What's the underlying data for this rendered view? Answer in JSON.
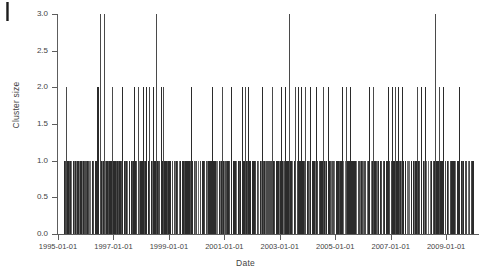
{
  "figure": {
    "artifact": "page-crop-mark"
  },
  "chart_data": {
    "type": "bar",
    "title": "",
    "subtitle": "",
    "xlabel": "Date",
    "ylabel": "Cluster size",
    "grid": false,
    "legend": null,
    "xlim": [
      "1995-01-01",
      "2009-12-31"
    ],
    "ylim": [
      0.0,
      3.0
    ],
    "ytick_labels": [
      "0.0",
      "0.5",
      "1.0",
      "1.5",
      "2.0",
      "2.5",
      "3.0"
    ],
    "ytick_values": [
      0.0,
      0.5,
      1.0,
      1.5,
      2.0,
      2.5,
      3.0
    ],
    "xtick_labels": [
      "1995-01-01",
      "1997-01-01",
      "1999-01-01",
      "2001-01-01",
      "2003-01-01",
      "2005-01-01",
      "2007-01-01",
      "2009-01-01"
    ],
    "xtick_values": [
      1995.0,
      1997.0,
      1999.0,
      2001.0,
      2003.0,
      2005.0,
      2007.0,
      2009.0
    ],
    "clusters_size_3": [
      1996.52,
      1996.66,
      1998.55,
      2003.35,
      2008.6
    ],
    "clusters_size_2": [
      1995.3,
      1996.4,
      1996.46,
      1996.95,
      1997.3,
      1997.75,
      1997.88,
      1998.05,
      1998.18,
      1998.3,
      1998.42,
      1998.7,
      1998.78,
      1999.8,
      2000.55,
      2000.92,
      2001.25,
      2001.62,
      2001.74,
      2001.86,
      2002.35,
      2002.72,
      2003.05,
      2003.18,
      2003.55,
      2003.66,
      2003.78,
      2003.92,
      2004.1,
      2004.3,
      2004.55,
      2004.74,
      2005.25,
      2005.4,
      2005.52,
      2006.2,
      2006.35,
      2006.9,
      2007.05,
      2007.16,
      2007.28,
      2007.4,
      2007.95,
      2008.1,
      2008.22,
      2008.75,
      2008.9,
      2009.45
    ],
    "size_1_band": {
      "start": 1995.18,
      "end": 2010.02,
      "count_approx": 420,
      "note": "hundreds of size-1 clusters forming an almost solid band at y = 1.0"
    }
  }
}
